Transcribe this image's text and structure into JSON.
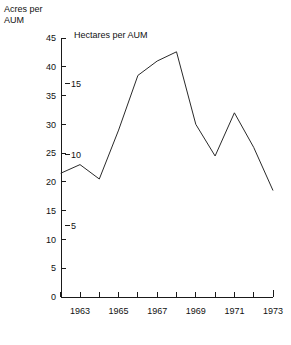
{
  "chart_data": {
    "type": "line",
    "title": "",
    "xlabel": "",
    "ylabel": "Acres per AUM",
    "ylabel2": "Hectares per AUM",
    "grid": false,
    "legend": "none",
    "x": [
      1962,
      1963,
      1964,
      1965,
      1966,
      1967,
      1968,
      1969,
      1970,
      1971,
      1972,
      1973
    ],
    "values": [
      21.5,
      23.0,
      20.5,
      29.0,
      38.5,
      41.0,
      42.6,
      30.0,
      24.5,
      32.0,
      26.0,
      18.5
    ],
    "categories": [
      "1962",
      "1963",
      "1964",
      "1965",
      "1966",
      "1967",
      "1968",
      "1969",
      "1970",
      "1971",
      "1972",
      "1973"
    ],
    "xlim": [
      1961.5,
      1973.5
    ],
    "ylim": [
      0,
      45
    ],
    "ylim2": [
      0,
      18.2
    ],
    "y_ticks": [
      0,
      5,
      10,
      15,
      20,
      25,
      30,
      35,
      40,
      45
    ],
    "y_tick_labels": [
      "0",
      "5",
      "10",
      "15",
      "20",
      "25",
      "30",
      "35",
      "40",
      "45"
    ],
    "y2_ticks": [
      5,
      10,
      15
    ],
    "y2_tick_labels": [
      "5",
      "10",
      "15"
    ],
    "x_ticks": [
      1962,
      1963,
      1964,
      1965,
      1966,
      1967,
      1968,
      1969,
      1970,
      1971,
      1972,
      1973
    ],
    "x_tick_labels": [
      "",
      "1963",
      "",
      "1965",
      "",
      "1967",
      "",
      "1969",
      "",
      "1971",
      "",
      "1973"
    ],
    "line_color": "#2a2a2a",
    "axis_color": "#1a1a1a"
  },
  "labels": {
    "left_axis_title": "Acres per\nAUM",
    "right_axis_title": "Hectares per AUM"
  }
}
